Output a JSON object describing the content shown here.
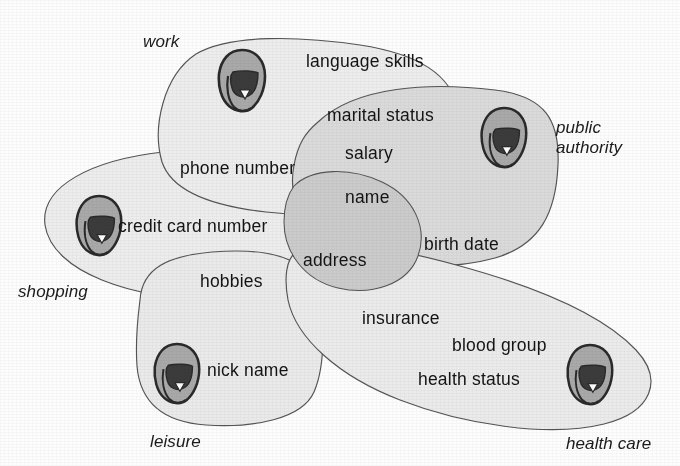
{
  "figure": {
    "kind": "venn-like-overlapping-regions-diagram",
    "background_color": "#fdfdfd",
    "outline_color": "#4a4a4a",
    "text_color": "#141414"
  },
  "regions": [
    {
      "id": "work",
      "label": "work",
      "label_x": 143,
      "label_y": 32,
      "fill": "#f1f1f1",
      "person_icon": "person-icon",
      "person_x": 212,
      "person_y": 46,
      "person_scale": 1.0
    },
    {
      "id": "public-authority",
      "label": "public\nauthority",
      "label_x": 556,
      "label_y": 118,
      "fill": "#eeeeee",
      "person_icon": "person-icon",
      "person_x": 475,
      "person_y": 104,
      "person_scale": 1.0
    },
    {
      "id": "shopping",
      "label": "shopping",
      "label_x": 18,
      "label_y": 282,
      "fill": "#f0f0f0",
      "person_icon": "person-icon",
      "person_x": 70,
      "person_y": 192,
      "person_scale": 1.0
    },
    {
      "id": "leisure",
      "label": "leisure",
      "label_x": 150,
      "label_y": 432,
      "fill": "#f0f0f0",
      "person_icon": "person-icon",
      "person_x": 148,
      "person_y": 340,
      "person_scale": 1.0
    },
    {
      "id": "health-care",
      "label": "health care",
      "label_x": 566,
      "label_y": 434,
      "fill": "#f1f1f1",
      "person_icon": "person-icon",
      "person_x": 561,
      "person_y": 341,
      "person_scale": 1.0
    }
  ],
  "attributes": [
    {
      "id": "language-skills",
      "label": "language skills",
      "x": 306,
      "y": 51
    },
    {
      "id": "marital-status",
      "label": "marital status",
      "x": 327,
      "y": 105
    },
    {
      "id": "salary",
      "label": "salary",
      "x": 345,
      "y": 143
    },
    {
      "id": "phone-number",
      "label": "phone number",
      "x": 180,
      "y": 158
    },
    {
      "id": "name",
      "label": "name",
      "x": 345,
      "y": 187
    },
    {
      "id": "credit-card-number",
      "label": "credit card number",
      "x": 118,
      "y": 216
    },
    {
      "id": "birth-date",
      "label": "birth date",
      "x": 424,
      "y": 234
    },
    {
      "id": "address",
      "label": "address",
      "x": 303,
      "y": 250
    },
    {
      "id": "hobbies",
      "label": "hobbies",
      "x": 200,
      "y": 271
    },
    {
      "id": "insurance",
      "label": "insurance",
      "x": 362,
      "y": 308
    },
    {
      "id": "blood-group",
      "label": "blood group",
      "x": 452,
      "y": 335
    },
    {
      "id": "nick-name",
      "label": "nick name",
      "x": 207,
      "y": 360
    },
    {
      "id": "health-status",
      "label": "health status",
      "x": 418,
      "y": 369
    }
  ]
}
